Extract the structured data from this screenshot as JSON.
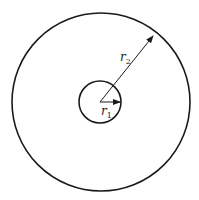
{
  "diagram": {
    "title": "",
    "center": [
      101,
      101
    ],
    "outer_circle": {
      "radius": 89,
      "stroke": "#1a1a1a"
    },
    "inner_circle": {
      "radius": 21,
      "stroke": "#1a1a1a"
    },
    "labels": {
      "r1": {
        "main": "r",
        "sub": "1"
      },
      "r2": {
        "main": "r",
        "sub": "2"
      }
    }
  }
}
